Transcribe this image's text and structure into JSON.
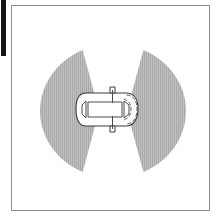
{
  "figure": {
    "caption": "Top view of a car with shaded detection zones on both sides"
  },
  "frame": {
    "name": "illustration-border",
    "border_color": "#8e8e8e",
    "background_color": "#ffffff",
    "x": 11,
    "y": 5,
    "width": 199,
    "height": 206
  },
  "page_edge": {
    "name": "page-edge-bar",
    "color": "#141414",
    "x": 1,
    "y": 0,
    "width": 5,
    "height": 56
  },
  "detection_zone": {
    "name": "blind-spot-zone",
    "shape": "ellipse-with-hourglass-cutout",
    "fill_color": "#b4b4b4",
    "pattern": "fine-vertical-hatch",
    "center_x": 113,
    "center_y": 111,
    "radius_x": 73,
    "radius_y": 67,
    "cutout": {
      "name": "clear-corridor",
      "shape": "hourglass",
      "color": "#ffffff",
      "waist_half_width": 14,
      "top_half_width": 33,
      "bottom_half_width": 33
    }
  },
  "vehicle": {
    "name": "car-top-view",
    "orientation": "top-down, front facing left",
    "outline_color": "#3a3a3a",
    "body_color": "#ffffff",
    "center_x": 107,
    "center_y": 109,
    "length": 62,
    "width": 34,
    "parts": [
      {
        "name": "car-body-outline",
        "shape": "rounded-rectangle"
      },
      {
        "name": "windshield",
        "shape": "trapezoid",
        "side": "front-left"
      },
      {
        "name": "rear-window",
        "shape": "trapezoid",
        "side": "rear-right"
      },
      {
        "name": "roof-panel",
        "shape": "rectangle"
      },
      {
        "name": "side-mirror-top",
        "shape": "tab"
      },
      {
        "name": "side-mirror-bottom",
        "shape": "tab"
      },
      {
        "name": "rear-bumper-dashed-arc",
        "shape": "dashed-arc"
      }
    ]
  },
  "colors": {
    "zone_gray": "#b4b4b4",
    "zone_gray_light": "#c8c8c8",
    "line_dark": "#3a3a3a",
    "frame_gray": "#8e8e8e",
    "white": "#ffffff",
    "black": "#141414"
  }
}
